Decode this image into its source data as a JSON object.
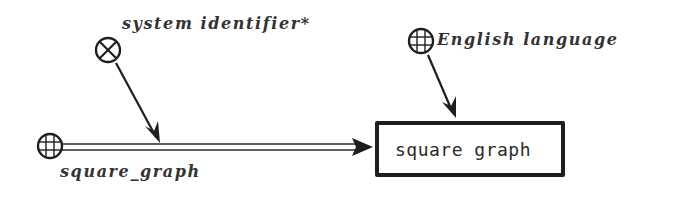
{
  "diagram": {
    "type": "concept-graph",
    "nodes": [
      {
        "id": "system_identifier",
        "label": "system identifier*",
        "icon": "x-circle-icon",
        "shape": "icon"
      },
      {
        "id": "english_language",
        "label": "English language",
        "icon": "globe-icon",
        "shape": "icon"
      },
      {
        "id": "square_graph_source",
        "label": "square_graph",
        "icon": "globe-icon",
        "shape": "icon"
      },
      {
        "id": "square_graph_box",
        "label": "square graph",
        "shape": "box"
      }
    ],
    "edges": [
      {
        "from": "square_graph_source",
        "to": "square_graph_box",
        "style": "double-line-arrow"
      },
      {
        "from": "system_identifier",
        "to": "square_graph_source-edge",
        "style": "single-arrow"
      },
      {
        "from": "english_language",
        "to": "square_graph_box",
        "style": "single-arrow"
      }
    ]
  },
  "labels": {
    "system_identifier": "system identifier*",
    "english_language": "English language",
    "square_graph_source": "square_graph",
    "square_graph_box": "square graph"
  },
  "colors": {
    "stroke": "#1e1e1e",
    "text": "#333333",
    "background": "#ffffff"
  }
}
